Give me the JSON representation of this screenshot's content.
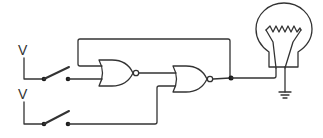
{
  "diagram": {
    "type": "circuit",
    "inputs": [
      {
        "label": "V",
        "component": "switch",
        "state": "open"
      },
      {
        "label": "V",
        "component": "switch",
        "state": "open"
      }
    ],
    "gates": [
      {
        "type": "NOR",
        "id": "gate-1"
      },
      {
        "type": "NOR",
        "id": "gate-2"
      }
    ],
    "output": {
      "component": "incandescent-lamp",
      "ground": true
    },
    "colors": {
      "line": "#333333",
      "background": "#ffffff"
    }
  }
}
